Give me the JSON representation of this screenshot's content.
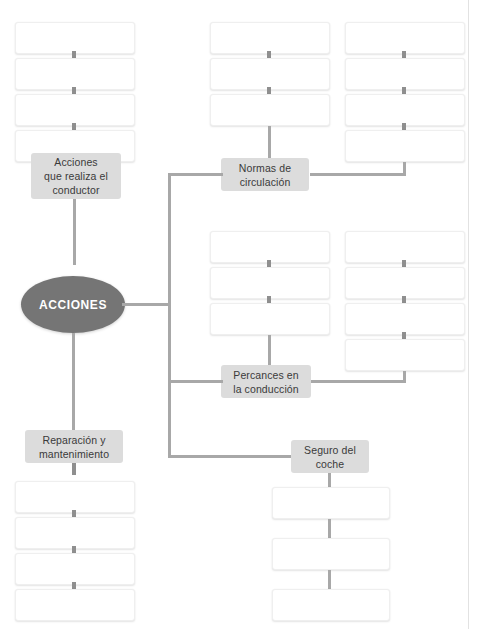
{
  "page": {
    "width": 484,
    "height": 629,
    "background": "#ffffff",
    "top_faint_text": "",
    "margin_rule_color": "#e2e2e2"
  },
  "colors": {
    "hub_fill": "#757575",
    "hub_text": "#ffffff",
    "chip_fill": "#dcdcdc",
    "chip_text": "#3a3a3a",
    "connector": "#a8a8a8",
    "tick": "#8f8f8f",
    "box_fill": "#ffffff",
    "box_border": "#efefef"
  },
  "diagram": {
    "type": "concept-map",
    "hub": {
      "label": "ACCIONES",
      "shape": "ellipse"
    },
    "branches": [
      {
        "id": "acciones-conductor",
        "label": "Acciones\nque realiza el\nconductor",
        "position": "top-left",
        "blank_boxes": 4,
        "boxes_location": "above"
      },
      {
        "id": "normas-circulacion",
        "label": "Normas de\ncirculación",
        "position": "top-center",
        "blank_boxes": 7,
        "columns": [
          3,
          4
        ],
        "boxes_location": "above"
      },
      {
        "id": "percances-conduccion",
        "label": "Percances en\nla conducción",
        "position": "middle-center",
        "blank_boxes": 7,
        "columns": [
          3,
          4
        ],
        "boxes_location": "above"
      },
      {
        "id": "reparacion-mantenimiento",
        "label": "Reparación y\nmantenimiento",
        "position": "bottom-left",
        "blank_boxes": 4,
        "boxes_location": "below"
      },
      {
        "id": "seguro-coche",
        "label": "Seguro del\ncoche",
        "position": "bottom-right",
        "blank_boxes": 3,
        "boxes_location": "below"
      }
    ]
  }
}
